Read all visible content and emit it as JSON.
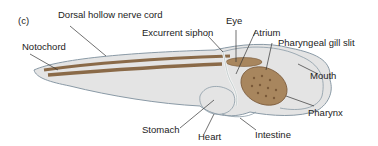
{
  "figure": {
    "panel_label": "(c)",
    "colors": {
      "body_fill": "#e4e4e4",
      "body_outline": "#8a9aa6",
      "organ_brown": "#a8865e",
      "organ_dark": "#7a5a3a",
      "leader_line": "#333333",
      "text": "#222222"
    },
    "labels": {
      "dorsal_nerve_cord": "Dorsal hollow nerve cord",
      "notochord": "Notochord",
      "excurrent_siphon": "Excurrent siphon",
      "eye": "Eye",
      "atrium": "Atrium",
      "pharyngeal_gill_slit": "Pharyngeal gill slit",
      "mouth": "Mouth",
      "pharynx": "Pharynx",
      "stomach": "Stomach",
      "heart": "Heart",
      "intestine": "Intestine"
    }
  }
}
